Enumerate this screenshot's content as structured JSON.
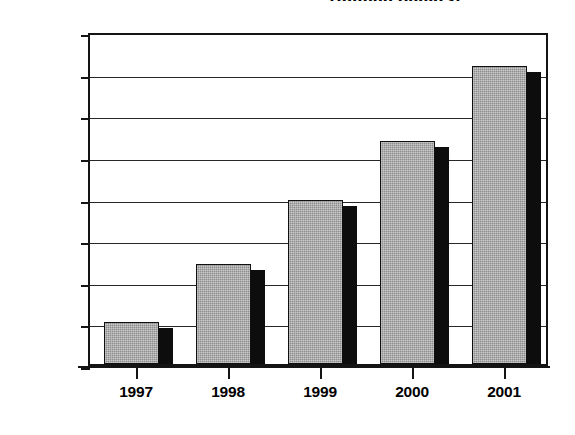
{
  "chart_data": {
    "type": "bar",
    "title": "(million dollars)",
    "xlabel": "",
    "ylabel": "",
    "categories": [
      "1997",
      "1998",
      "1999",
      "2000",
      "2001"
    ],
    "values": [
      6000,
      7400,
      8950,
      10350,
      12150
    ],
    "series": [
      {
        "name": "",
        "values": [
          6000,
          7400,
          8950,
          10350,
          12150
        ]
      }
    ],
    "ylim": [
      5000,
      13000
    ],
    "ytick_step": 1000,
    "ytick_labels": [
      "13,000",
      "12,000",
      "11,000",
      "10,000",
      "9,000",
      "8,000",
      "7,000",
      "6,000",
      "5,000"
    ],
    "ytick_values": [
      13000,
      12000,
      11000,
      10000,
      9000,
      8000,
      7000,
      6000,
      5000
    ],
    "grid": true,
    "legend": false,
    "legend_position": "none",
    "bar_fill_color": "#8e8e8e",
    "bar_shadow_color": "#0d0d0d",
    "axis_color": "#141414",
    "background_color": "#ffffff"
  }
}
